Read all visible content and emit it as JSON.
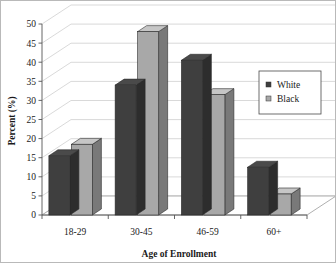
{
  "chart_data": {
    "type": "bar",
    "title": "",
    "subtitle": "",
    "xlabel": "Age of Enrollment",
    "ylabel": "Percent (%)",
    "categories": [
      "18-29",
      "30-45",
      "46-59",
      "60+"
    ],
    "series": [
      {
        "name": "White",
        "values": [
          15.5,
          34,
          40.5,
          12.5
        ],
        "color": "#3f3f3f"
      },
      {
        "name": "Black",
        "values": [
          18.5,
          48,
          31.5,
          5.5
        ],
        "color": "#a8a8a8"
      }
    ],
    "ylim": [
      0,
      50
    ],
    "ytick_step": 5,
    "ytick_labels": [
      "0",
      "5",
      "10",
      "15",
      "20",
      "25",
      "30",
      "35",
      "40",
      "45",
      "50"
    ],
    "grid": true,
    "grid_axis": "y",
    "legend_position": "top-right",
    "style": "3d-column",
    "background_color": "#ffffff",
    "axis_color": "#555555",
    "grid_color": "#c8c8c8"
  },
  "legend": {
    "entries": [
      {
        "label": "White",
        "swatch_color": "#3f3f3f"
      },
      {
        "label": "Black",
        "swatch_color": "#a8a8a8"
      }
    ]
  }
}
